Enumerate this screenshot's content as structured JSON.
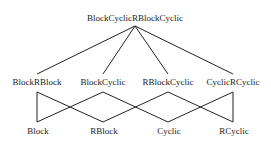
{
  "diagram": {
    "root": {
      "id": "root",
      "label": "BlockCyclicRBlockCyclic",
      "x": 135,
      "y": 14
    },
    "middle": [
      {
        "id": "m0",
        "label": "BlockRBlock",
        "x": 37,
        "y": 78
      },
      {
        "id": "m1",
        "label": "BlockCyclic",
        "x": 103,
        "y": 78
      },
      {
        "id": "m2",
        "label": "RBlockCyclic",
        "x": 168,
        "y": 78
      },
      {
        "id": "m3",
        "label": "CyclicRCyclic",
        "x": 233,
        "y": 78
      }
    ],
    "leaves": [
      {
        "id": "l0",
        "label": "Block",
        "x": 38,
        "y": 127
      },
      {
        "id": "l1",
        "label": "RBlock",
        "x": 104,
        "y": 127
      },
      {
        "id": "l2",
        "label": "Cyclic",
        "x": 169,
        "y": 127
      },
      {
        "id": "l3",
        "label": "RCyclic",
        "x": 234,
        "y": 127
      }
    ],
    "edges": [
      {
        "from": [
          135,
          26
        ],
        "to": [
          37,
          74
        ]
      },
      {
        "from": [
          135,
          26
        ],
        "to": [
          103,
          74
        ]
      },
      {
        "from": [
          135,
          26
        ],
        "to": [
          168,
          74
        ]
      },
      {
        "from": [
          135,
          26
        ],
        "to": [
          233,
          74
        ]
      },
      {
        "from": [
          37,
          92
        ],
        "to": [
          37,
          122
        ]
      },
      {
        "from": [
          37,
          92
        ],
        "to": [
          103,
          122
        ]
      },
      {
        "from": [
          103,
          92
        ],
        "to": [
          37,
          122
        ]
      },
      {
        "from": [
          103,
          92
        ],
        "to": [
          168,
          122
        ]
      },
      {
        "from": [
          168,
          92
        ],
        "to": [
          103,
          122
        ]
      },
      {
        "from": [
          168,
          92
        ],
        "to": [
          233,
          122
        ]
      },
      {
        "from": [
          233,
          92
        ],
        "to": [
          168,
          122
        ]
      },
      {
        "from": [
          233,
          92
        ],
        "to": [
          233,
          122
        ]
      }
    ],
    "line_color": "#222222"
  }
}
